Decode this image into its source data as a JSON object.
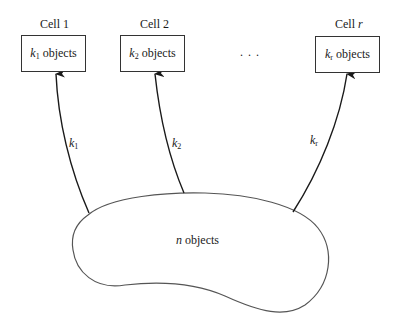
{
  "cells": [
    {
      "title_prefix": "Cell ",
      "title_index": "1",
      "var": "k",
      "sub": "1",
      "text": " objects",
      "arrow_var": "k",
      "arrow_sub": "1"
    },
    {
      "title_prefix": "Cell ",
      "title_index": "2",
      "var": "k",
      "sub": "2",
      "text": " objects",
      "arrow_var": "k",
      "arrow_sub": "2"
    },
    {
      "title_prefix": "Cell ",
      "title_index": "r",
      "var": "k",
      "sub": "r",
      "text": " objects",
      "arrow_var": "k",
      "arrow_sub": "r"
    }
  ],
  "ellipsis": ". . .",
  "source": {
    "var": "n",
    "text": " objects"
  },
  "colors": {
    "stroke": "#1a1a1a",
    "blob_stroke": "#555555"
  }
}
